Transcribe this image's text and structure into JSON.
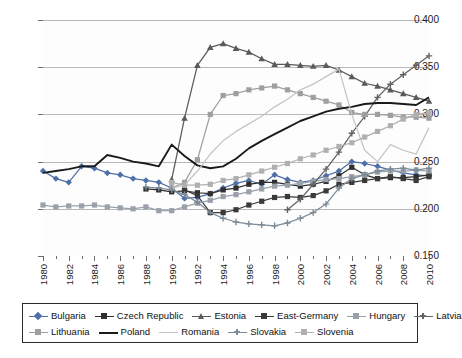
{
  "chart_data": {
    "type": "line",
    "title": "",
    "xlabel": "",
    "ylabel": "",
    "xlim": [
      1980,
      2010
    ],
    "ylim": [
      0.15,
      0.4
    ],
    "ytick_labels": [
      "0.400",
      "0.350",
      "0.300",
      "0.250",
      "0.200",
      "0.150"
    ],
    "ytick_values": [
      0.4,
      0.35,
      0.3,
      0.25,
      0.2,
      0.15
    ],
    "grid": true,
    "grid_axis": "y",
    "legend_position": "bottom",
    "x": [
      1980,
      1981,
      1982,
      1983,
      1984,
      1985,
      1986,
      1987,
      1988,
      1989,
      1990,
      1991,
      1992,
      1993,
      1994,
      1995,
      1996,
      1997,
      1998,
      1999,
      2000,
      2001,
      2002,
      2003,
      2004,
      2005,
      2006,
      2007,
      2008,
      2009,
      2010
    ],
    "xtick_labels": [
      "1980",
      "1982",
      "1984",
      "1986",
      "1988",
      "1990",
      "1992",
      "1994",
      "1996",
      "1998",
      "2000",
      "2002",
      "2004",
      "2006",
      "2008",
      "2010"
    ],
    "series": [
      {
        "name": "Bulgaria",
        "color": "#4f6fa8",
        "marker": "diamond",
        "values": [
          0.24,
          0.232,
          0.228,
          0.245,
          0.243,
          0.238,
          0.236,
          0.232,
          0.23,
          0.228,
          0.222,
          0.211,
          0.212,
          0.216,
          0.222,
          0.227,
          0.23,
          0.226,
          0.236,
          0.231,
          0.228,
          0.23,
          0.235,
          0.24,
          0.25,
          0.248,
          0.245,
          0.241,
          0.238,
          0.236,
          0.235
        ]
      },
      {
        "name": "Czech Republic",
        "color": "#2f2f2f",
        "marker": "square",
        "values": [
          null,
          null,
          null,
          null,
          null,
          null,
          null,
          null,
          0.221,
          0.22,
          0.218,
          0.219,
          0.217,
          0.216,
          0.22,
          0.222,
          0.226,
          0.228,
          0.228,
          0.226,
          0.224,
          0.226,
          0.229,
          0.235,
          0.244,
          0.236,
          0.232,
          0.233,
          0.233,
          0.234,
          0.236
        ]
      },
      {
        "name": "Estonia",
        "color": "#5a5a5a",
        "marker": "triangle",
        "values": [
          null,
          null,
          null,
          null,
          null,
          null,
          null,
          null,
          null,
          null,
          0.231,
          0.296,
          0.352,
          0.371,
          0.375,
          0.37,
          0.366,
          0.359,
          0.353,
          0.353,
          0.352,
          0.351,
          0.352,
          0.347,
          0.34,
          0.333,
          0.33,
          0.326,
          0.322,
          0.318,
          0.314
        ]
      },
      {
        "name": "East-Germany",
        "color": "#3a3a3a",
        "marker": "square",
        "values": [
          null,
          null,
          null,
          null,
          null,
          null,
          null,
          null,
          null,
          null,
          null,
          0.22,
          0.214,
          0.196,
          0.196,
          0.199,
          0.204,
          0.208,
          0.212,
          0.213,
          0.212,
          0.214,
          0.219,
          0.226,
          0.228,
          0.23,
          0.232,
          0.234,
          0.232,
          0.23,
          0.234
        ]
      },
      {
        "name": "Hungary",
        "color": "#9aa1ab",
        "marker": "square",
        "values": [
          0.204,
          0.202,
          0.203,
          0.203,
          0.204,
          0.202,
          0.201,
          0.2,
          0.202,
          0.198,
          0.198,
          0.202,
          0.206,
          0.209,
          0.213,
          0.215,
          0.218,
          0.221,
          0.224,
          0.225,
          0.227,
          0.229,
          0.231,
          0.232,
          0.234,
          0.236,
          0.239,
          0.24,
          0.24,
          0.241,
          0.24
        ]
      },
      {
        "name": "Latvia",
        "color": "#646464",
        "marker": "plus",
        "values": [
          null,
          null,
          null,
          null,
          null,
          null,
          null,
          null,
          null,
          null,
          null,
          null,
          null,
          null,
          null,
          null,
          null,
          null,
          null,
          0.199,
          0.21,
          0.226,
          0.242,
          0.26,
          0.28,
          0.298,
          0.318,
          0.332,
          0.342,
          0.352,
          0.362
        ]
      },
      {
        "name": "Lithuania",
        "color": "#9f9f9f",
        "marker": "square",
        "values": [
          null,
          null,
          null,
          null,
          null,
          null,
          null,
          null,
          null,
          null,
          0.222,
          0.228,
          0.252,
          0.3,
          0.32,
          0.322,
          0.326,
          0.328,
          0.33,
          0.326,
          0.322,
          0.318,
          0.314,
          0.31,
          0.302,
          0.3,
          0.3,
          0.299,
          0.297,
          0.297,
          0.296
        ]
      },
      {
        "name": "Poland",
        "color": "#1a1a1a",
        "marker": "none",
        "values": [
          0.238,
          0.24,
          0.242,
          0.245,
          0.245,
          0.257,
          0.254,
          0.25,
          0.248,
          0.245,
          0.268,
          0.256,
          0.246,
          0.243,
          0.245,
          0.253,
          0.264,
          0.272,
          0.279,
          0.286,
          0.293,
          0.298,
          0.303,
          0.306,
          0.308,
          0.311,
          0.312,
          0.312,
          0.311,
          0.31,
          0.318
        ]
      },
      {
        "name": "Romania",
        "color": "#c4c4c4",
        "marker": "none",
        "values": [
          null,
          null,
          null,
          null,
          null,
          null,
          null,
          null,
          null,
          null,
          0.222,
          0.225,
          0.24,
          0.258,
          0.272,
          0.282,
          0.29,
          0.298,
          0.308,
          0.316,
          0.326,
          0.332,
          0.34,
          0.348,
          0.3,
          0.262,
          0.25,
          0.268,
          0.262,
          0.258,
          0.286
        ]
      },
      {
        "name": "Slovakia",
        "color": "#7d8b97",
        "marker": "plus",
        "values": [
          null,
          null,
          null,
          null,
          null,
          null,
          null,
          null,
          0.223,
          0.222,
          0.22,
          0.215,
          0.207,
          0.196,
          0.19,
          0.186,
          0.184,
          0.183,
          0.182,
          0.185,
          0.19,
          0.196,
          0.205,
          0.222,
          0.232,
          0.236,
          0.24,
          0.242,
          0.243,
          0.241,
          0.243
        ]
      },
      {
        "name": "Slovenia",
        "color": "#b0b0b0",
        "marker": "square",
        "values": [
          null,
          null,
          null,
          null,
          null,
          null,
          null,
          null,
          null,
          null,
          0.228,
          0.225,
          0.225,
          0.226,
          0.23,
          0.232,
          0.236,
          0.24,
          0.244,
          0.248,
          0.253,
          0.257,
          0.262,
          0.266,
          0.27,
          0.276,
          0.282,
          0.288,
          0.295,
          0.3,
          0.302
        ]
      }
    ]
  },
  "legend": {
    "rows": [
      [
        "Bulgaria",
        "Czech Republic",
        "Estonia",
        "East-Germany",
        "Hungary",
        "Latvia"
      ],
      [
        "Lithuania",
        "Poland",
        "Romania",
        "Slovakia",
        "Slovenia"
      ]
    ]
  }
}
